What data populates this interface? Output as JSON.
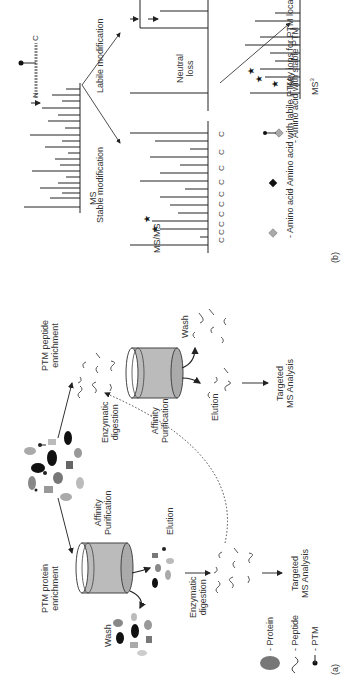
{
  "panel_a": {
    "tag": "(a)",
    "protein_route": {
      "title_line1": "PTM protein",
      "title_line2": "enrichment",
      "wash": "Wash",
      "affinity_line1": "Affinity",
      "affinity_line2": "Purification",
      "elution": "Elution",
      "digestion_line1": "Enzymatic",
      "digestion_line2": "digestion",
      "analysis_line1": "Targeted",
      "analysis_line2": "MS Analysis"
    },
    "peptide_route": {
      "title_line1": "PTM peptide",
      "title_line2": "enrichment",
      "digestion_line1": "Enzymatic",
      "digestion_line2": "digestion",
      "affinity_line1": "Affinity",
      "affinity_line2": "Purification",
      "wash": "Wash",
      "elution": "Elution",
      "analysis_line1": "Targeted",
      "analysis_line2": "MS Analysis"
    },
    "legend": [
      {
        "icon": "protein-icon",
        "label": "- Protein"
      },
      {
        "icon": "peptide-icon",
        "label": "- Peptide"
      },
      {
        "icon": "ptm-icon",
        "label": "- PTM"
      }
    ]
  },
  "panel_b": {
    "tag": "(b)",
    "ms_label": "MS",
    "stable_label": "Stable modification",
    "labile_label": "Labile modification",
    "msms_label": "MS/MS",
    "neutral_loss_line1": "Neutral",
    "neutral_loss_line2": "loss",
    "ms3_label": "MS",
    "ms3_sup": "3",
    "n_term": "N",
    "c_term": "C",
    "legend": [
      {
        "icon": "amino-acid-icon",
        "label": "- Amino acid"
      },
      {
        "icon": "labile-ptm-amino-acid-icon",
        "label": "- Amino acid with labile PTM"
      },
      {
        "icon": "stable-ptm-amino-acid-icon",
        "label": "- Amino acid with stable PTM"
      },
      {
        "icon": "key-ion-star-icon",
        "label": "- Key ions for PTM localization"
      }
    ]
  },
  "colors": {
    "line": "#333333",
    "gray_fill": "#9a9a9a",
    "light_gray": "#c8c8c8",
    "dark": "#111111"
  }
}
